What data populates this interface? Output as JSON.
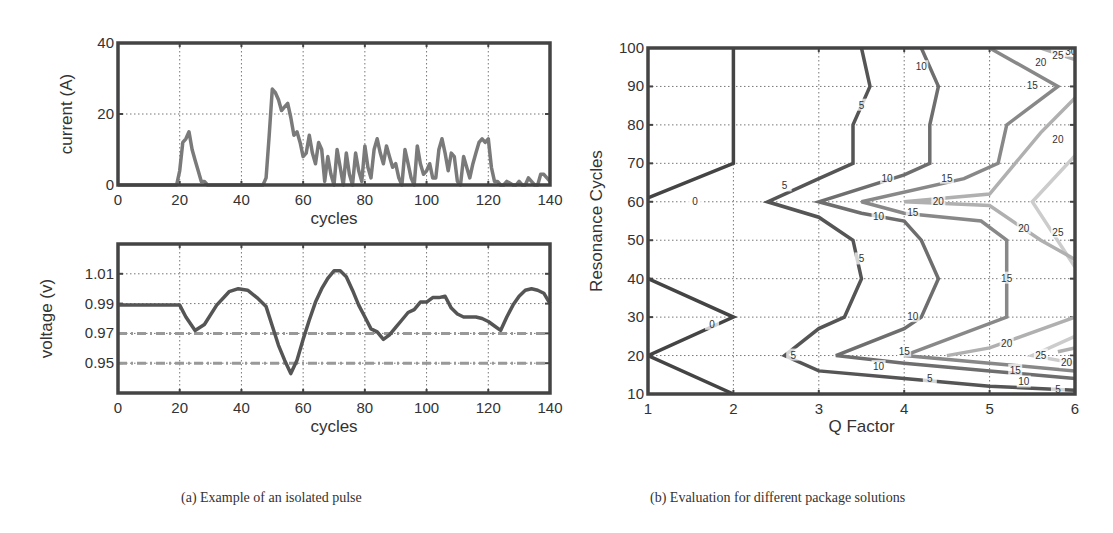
{
  "captions": {
    "a": "(a) Example of an isolated pulse",
    "b": "(b) Evaluation for different package solutions"
  },
  "chart_data": [
    {
      "id": "current",
      "type": "line",
      "title": "",
      "xlabel": "cycles",
      "ylabel": "current (A)",
      "xlim": [
        0,
        140
      ],
      "ylim": [
        0,
        40
      ],
      "xticks": [
        0,
        20,
        40,
        60,
        80,
        100,
        120,
        140
      ],
      "yticks": [
        0,
        20,
        40
      ],
      "grid": true,
      "series": [
        {
          "name": "current",
          "color": "#7a7a7a",
          "x": [
            0,
            19,
            20,
            21,
            22,
            23,
            24,
            25,
            26,
            27,
            28,
            29,
            30,
            47,
            48,
            49,
            50,
            51,
            52,
            53,
            54,
            55,
            56,
            57,
            58,
            59,
            60,
            61,
            62,
            63,
            64,
            65,
            66,
            67,
            68,
            69,
            70,
            71,
            72,
            73,
            74,
            75,
            76,
            77,
            78,
            79,
            80,
            81,
            82,
            83,
            84,
            85,
            86,
            87,
            88,
            89,
            90,
            91,
            92,
            93,
            94,
            95,
            96,
            97,
            98,
            99,
            100,
            101,
            102,
            103,
            104,
            105,
            106,
            107,
            108,
            109,
            110,
            111,
            112,
            113,
            114,
            115,
            116,
            117,
            118,
            119,
            120,
            121,
            122,
            123,
            124,
            125,
            126,
            128,
            129,
            130,
            131,
            132,
            133,
            134,
            135,
            136,
            137,
            138,
            139,
            140
          ],
          "y": [
            0,
            0,
            4,
            12,
            13,
            15,
            10,
            7,
            4,
            1,
            1,
            0,
            0,
            0,
            2,
            14,
            27,
            26,
            24,
            21,
            22,
            23,
            19,
            14,
            15,
            12,
            8,
            9,
            14,
            9,
            6,
            12,
            10,
            1,
            8,
            3,
            0,
            10,
            5,
            0,
            9,
            3,
            0,
            9,
            4,
            1,
            11,
            5,
            2,
            10,
            13,
            9,
            6,
            11,
            8,
            5,
            6,
            2,
            0,
            10,
            6,
            2,
            0,
            11,
            6,
            3,
            4,
            6,
            2,
            2,
            10,
            13,
            9,
            4,
            9,
            8,
            1,
            0,
            8,
            5,
            2,
            6,
            9,
            12,
            13,
            12,
            13,
            5,
            1,
            1,
            0,
            0,
            1,
            0,
            0,
            1,
            0,
            0,
            2,
            1,
            0,
            0,
            3,
            3,
            2,
            1
          ]
        }
      ]
    },
    {
      "id": "voltage",
      "type": "line",
      "title": "",
      "xlabel": "cycles",
      "ylabel": "voltage (v)",
      "xlim": [
        0,
        140
      ],
      "ylim": [
        0.93,
        1.03
      ],
      "xticks": [
        0,
        20,
        40,
        60,
        80,
        100,
        120,
        140
      ],
      "yticks": [
        0.95,
        0.97,
        0.99,
        1.01
      ],
      "ytick_labels": [
        "0.95",
        "0.97",
        "0.99",
        "1.01"
      ],
      "grid": true,
      "series": [
        {
          "name": "voltage",
          "color": "#555555",
          "x": [
            0,
            20,
            22,
            25,
            28,
            32,
            36,
            39,
            42,
            45,
            48,
            50,
            52,
            54,
            56,
            58,
            60,
            62,
            64,
            66,
            68,
            70,
            72,
            74,
            76,
            78,
            80,
            82,
            84,
            86,
            88,
            90,
            92,
            94,
            96,
            98,
            100,
            102,
            104,
            106,
            108,
            110,
            112,
            114,
            116,
            118,
            120,
            122,
            124,
            126,
            128,
            130,
            132,
            134,
            136,
            138,
            140
          ],
          "y": [
            0.989,
            0.989,
            0.981,
            0.972,
            0.976,
            0.989,
            0.998,
            1.0,
            0.999,
            0.994,
            0.988,
            0.975,
            0.962,
            0.952,
            0.943,
            0.952,
            0.966,
            0.979,
            0.991,
            1.0,
            1.007,
            1.012,
            1.012,
            1.008,
            0.999,
            0.989,
            0.981,
            0.973,
            0.971,
            0.966,
            0.969,
            0.974,
            0.979,
            0.984,
            0.986,
            0.991,
            0.991,
            0.994,
            0.994,
            0.995,
            0.987,
            0.983,
            0.981,
            0.981,
            0.981,
            0.98,
            0.978,
            0.975,
            0.972,
            0.981,
            0.989,
            0.995,
            0.999,
            1.0,
            0.999,
            0.997,
            0.99
          ]
        }
      ],
      "reference_lines": [
        {
          "y": 0.97,
          "style": "dash-dot",
          "color": "#999999"
        },
        {
          "y": 0.95,
          "style": "dash-dot",
          "color": "#999999"
        }
      ]
    },
    {
      "id": "contour",
      "type": "contour",
      "title": "",
      "xlabel": "Q Factor",
      "ylabel": "Resonance Cycles",
      "xlim": [
        1,
        6
      ],
      "ylim": [
        10,
        100
      ],
      "xticks": [
        1,
        2,
        3,
        4,
        5,
        6
      ],
      "yticks": [
        10,
        20,
        30,
        40,
        50,
        60,
        70,
        80,
        90,
        100
      ],
      "grid": true,
      "levels": [
        {
          "level": 0,
          "color": "#444444",
          "paths": [
            [
              [
                2.0,
                100
              ],
              [
                2.0,
                70
              ],
              [
                1.0,
                61
              ]
            ],
            [
              [
                1.0,
                40
              ],
              [
                2.0,
                30
              ],
              [
                1.0,
                20
              ],
              [
                2.0,
                10
              ]
            ]
          ],
          "labels": [
            {
              "text": "0",
              "x": 1.55,
              "y": 60
            },
            {
              "text": "0",
              "x": 1.75,
              "y": 28
            }
          ]
        },
        {
          "level": 5,
          "color": "#555555",
          "paths": [
            [
              [
                3.5,
                100
              ],
              [
                3.6,
                90
              ],
              [
                3.4,
                80
              ],
              [
                3.4,
                70
              ],
              [
                3.0,
                66
              ],
              [
                2.4,
                60
              ],
              [
                3.0,
                56
              ],
              [
                3.4,
                50
              ],
              [
                3.5,
                40
              ],
              [
                3.3,
                30
              ],
              [
                3.0,
                27
              ],
              [
                2.6,
                20
              ],
              [
                3.0,
                16
              ],
              [
                4.0,
                14
              ],
              [
                5.0,
                12
              ],
              [
                6.0,
                11
              ]
            ]
          ],
          "labels": [
            {
              "text": "5",
              "x": 3.5,
              "y": 85
            },
            {
              "text": "5",
              "x": 2.6,
              "y": 64
            },
            {
              "text": "5",
              "x": 3.5,
              "y": 45
            },
            {
              "text": "5",
              "x": 2.7,
              "y": 20
            },
            {
              "text": "5",
              "x": 4.3,
              "y": 14
            },
            {
              "text": "5",
              "x": 5.8,
              "y": 11
            }
          ]
        },
        {
          "level": 10,
          "color": "#6e6e6e",
          "paths": [
            [
              [
                4.2,
                100
              ],
              [
                4.4,
                90
              ],
              [
                4.3,
                80
              ],
              [
                4.3,
                70
              ],
              [
                4.0,
                67
              ],
              [
                3.0,
                60
              ],
              [
                3.5,
                57
              ],
              [
                4.0,
                55
              ],
              [
                4.2,
                50
              ],
              [
                4.4,
                40
              ],
              [
                4.2,
                30
              ],
              [
                4.0,
                27
              ],
              [
                3.2,
                20
              ],
              [
                4.0,
                18
              ],
              [
                5.0,
                16
              ],
              [
                6.0,
                14
              ]
            ]
          ],
          "labels": [
            {
              "text": "10",
              "x": 4.2,
              "y": 95
            },
            {
              "text": "10",
              "x": 3.8,
              "y": 66
            },
            {
              "text": "10",
              "x": 3.7,
              "y": 56
            },
            {
              "text": "10",
              "x": 4.1,
              "y": 30
            },
            {
              "text": "10",
              "x": 3.7,
              "y": 17
            },
            {
              "text": "10",
              "x": 5.4,
              "y": 13
            }
          ]
        },
        {
          "level": 15,
          "color": "#888888",
          "paths": [
            [
              [
                5.0,
                100
              ],
              [
                5.8,
                90
              ],
              [
                5.2,
                80
              ],
              [
                5.1,
                70
              ],
              [
                4.7,
                66
              ],
              [
                3.5,
                60
              ],
              [
                4.0,
                57
              ],
              [
                4.9,
                55
              ],
              [
                5.2,
                50
              ],
              [
                5.2,
                40
              ],
              [
                5.2,
                30
              ],
              [
                4.0,
                20
              ],
              [
                5.0,
                18
              ],
              [
                6.0,
                16
              ]
            ]
          ],
          "labels": [
            {
              "text": "15",
              "x": 5.5,
              "y": 90
            },
            {
              "text": "15",
              "x": 4.5,
              "y": 66
            },
            {
              "text": "15",
              "x": 4.1,
              "y": 57
            },
            {
              "text": "15",
              "x": 5.2,
              "y": 40
            },
            {
              "text": "15",
              "x": 4.0,
              "y": 21
            },
            {
              "text": "15",
              "x": 5.3,
              "y": 16
            }
          ]
        },
        {
          "level": 20,
          "color": "#b0b0b0",
          "paths": [
            [
              [
                5.6,
                100
              ],
              [
                6.0,
                97
              ]
            ],
            [
              [
                6.0,
                87
              ],
              [
                5.6,
                78
              ],
              [
                5.0,
                62
              ],
              [
                4.0,
                60
              ],
              [
                5.0,
                59
              ],
              [
                5.6,
                50
              ],
              [
                6.0,
                45
              ]
            ],
            [
              [
                6.0,
                30
              ],
              [
                5.0,
                22
              ],
              [
                4.5,
                20
              ]
            ],
            [
              [
                6.0,
                22
              ],
              [
                5.8,
                21
              ]
            ]
          ],
          "labels": [
            {
              "text": "20",
              "x": 5.6,
              "y": 96
            },
            {
              "text": "20",
              "x": 5.8,
              "y": 76
            },
            {
              "text": "20",
              "x": 4.4,
              "y": 60
            },
            {
              "text": "20",
              "x": 5.4,
              "y": 53
            },
            {
              "text": "20",
              "x": 5.2,
              "y": 23
            },
            {
              "text": "20",
              "x": 5.9,
              "y": 18
            }
          ]
        },
        {
          "level": 25,
          "color": "#cccccc",
          "paths": [
            [
              [
                5.8,
                100
              ],
              [
                6.0,
                99
              ]
            ],
            [
              [
                6.0,
                72
              ],
              [
                5.5,
                60
              ],
              [
                6.0,
                43
              ]
            ],
            [
              [
                6.0,
                25
              ],
              [
                5.5,
                20
              ],
              [
                6.0,
                18
              ]
            ]
          ],
          "labels": [
            {
              "text": "25",
              "x": 5.8,
              "y": 98
            },
            {
              "text": "25",
              "x": 5.8,
              "y": 52
            },
            {
              "text": "25",
              "x": 5.6,
              "y": 20
            }
          ]
        },
        {
          "level": 30,
          "color": "#dddddd",
          "paths": [
            [
              [
                5.95,
                100
              ],
              [
                6.0,
                99.5
              ]
            ]
          ],
          "labels": [
            {
              "text": "30",
              "x": 5.95,
              "y": 99
            }
          ]
        }
      ]
    }
  ]
}
